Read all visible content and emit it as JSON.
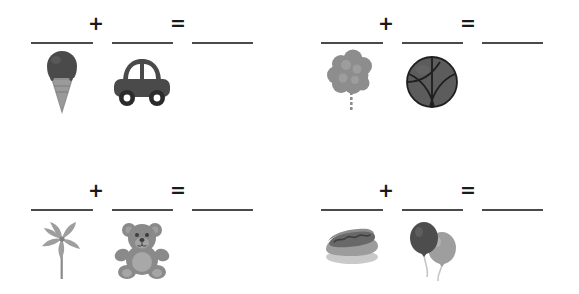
{
  "worksheet": {
    "background_color": "#ffffff",
    "line_color": "#4a4a4a",
    "symbol_color": "#1a1a1a",
    "plus_symbol": "+",
    "equals_symbol": "=",
    "problems": [
      {
        "id": "problem-1",
        "operand_a": {
          "icon": "ice-cream-cone-icon",
          "label": "ice cream cone"
        },
        "operand_b": {
          "icon": "car-icon",
          "label": "car"
        },
        "plus": "+",
        "equals": "=",
        "answer_a": "",
        "answer_b": "",
        "answer_c": ""
      },
      {
        "id": "problem-2",
        "operand_a": {
          "icon": "cotton-candy-icon",
          "label": "cotton candy"
        },
        "operand_b": {
          "icon": "basketball-icon",
          "label": "basketball"
        },
        "plus": "+",
        "equals": "=",
        "answer_a": "",
        "answer_b": "",
        "answer_c": ""
      },
      {
        "id": "problem-3",
        "operand_a": {
          "icon": "pinwheel-lollipop-icon",
          "label": "pinwheel lollipop"
        },
        "operand_b": {
          "icon": "teddy-bear-icon",
          "label": "teddy bear"
        },
        "plus": "+",
        "equals": "=",
        "answer_a": "",
        "answer_b": "",
        "answer_c": ""
      },
      {
        "id": "problem-4",
        "operand_a": {
          "icon": "hot-dog-icon",
          "label": "hot dog"
        },
        "operand_b": {
          "icon": "balloons-icon",
          "label": "balloons"
        },
        "plus": "+",
        "equals": "=",
        "answer_a": "",
        "answer_b": "",
        "answer_c": ""
      }
    ]
  }
}
